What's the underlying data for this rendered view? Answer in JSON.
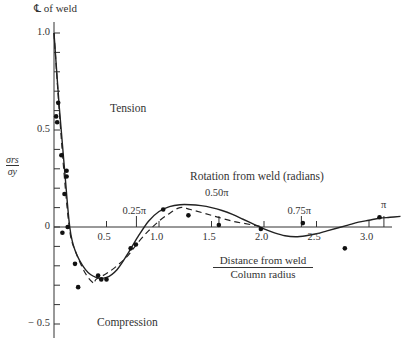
{
  "chart_data": {
    "type": "line",
    "title": "",
    "top_annotation": "℄ of weld",
    "xlabel_numerator": "Distance from weld",
    "xlabel_denominator": "Column radius",
    "ylabel_numerator": "σrs",
    "ylabel_denominator": "σy",
    "xlim": [
      0,
      3.3
    ],
    "ylim": [
      -0.55,
      1.05
    ],
    "x_ticks": [
      "0.5",
      "1.0",
      "1.5",
      "2.0",
      "2.5",
      "3.0"
    ],
    "x_tick_values": [
      0.5,
      1.0,
      1.5,
      2.0,
      2.5,
      3.0
    ],
    "y_ticks": [
      "1.0",
      "0.5",
      "0",
      "− 0.5"
    ],
    "y_tick_values": [
      1.0,
      0.5,
      0,
      -0.5
    ],
    "secondary_axis_label": "Rotation from weld (radians)",
    "secondary_ticks": [
      "0.25π",
      "0.50π",
      "0.75π",
      "π"
    ],
    "secondary_tick_positions": [
      0.785,
      1.571,
      2.356,
      3.142
    ],
    "region_labels": {
      "upper": "Tension",
      "lower": "Compression"
    },
    "grid": false,
    "series": [
      {
        "name": "Theory (solid)",
        "style": "solid",
        "x": [
          0.0,
          0.05,
          0.1,
          0.15,
          0.2,
          0.3,
          0.4,
          0.5,
          0.6,
          0.7,
          0.8,
          0.9,
          1.0,
          1.1,
          1.2,
          1.3,
          1.4,
          1.5,
          1.6,
          1.7,
          1.8,
          1.9,
          2.0,
          2.1,
          2.2,
          2.3,
          2.4,
          2.5,
          2.6,
          2.7,
          2.8,
          2.9,
          3.0,
          3.1,
          3.2,
          3.3
        ],
        "values": [
          1.0,
          0.62,
          0.3,
          0.0,
          -0.12,
          -0.22,
          -0.26,
          -0.26,
          -0.22,
          -0.14,
          -0.05,
          0.03,
          0.08,
          0.105,
          0.115,
          0.115,
          0.11,
          0.1,
          0.085,
          0.065,
          0.04,
          0.015,
          -0.01,
          -0.03,
          -0.045,
          -0.05,
          -0.045,
          -0.035,
          -0.02,
          -0.005,
          0.01,
          0.025,
          0.035,
          0.045,
          0.05,
          0.055
        ]
      },
      {
        "name": "Theory (dashed)",
        "style": "dashed",
        "x": [
          0.0,
          0.05,
          0.1,
          0.15,
          0.2,
          0.3,
          0.38,
          0.4,
          0.5,
          0.6,
          0.7,
          0.8,
          0.9,
          1.0,
          1.1,
          1.2,
          1.3,
          1.5,
          1.7,
          1.9,
          2.0
        ],
        "values": [
          1.0,
          0.6,
          0.25,
          -0.02,
          -0.12,
          -0.24,
          -0.29,
          -0.27,
          -0.24,
          -0.2,
          -0.15,
          -0.08,
          -0.02,
          0.03,
          0.07,
          0.1,
          0.09,
          0.06,
          0.03,
          0.01,
          0.0
        ]
      },
      {
        "name": "Experimental points",
        "style": "markers",
        "x": [
          0.02,
          0.03,
          0.04,
          0.07,
          0.1,
          0.12,
          0.12,
          0.13,
          0.08,
          0.2,
          0.23,
          0.42,
          0.45,
          0.5,
          0.73,
          0.78,
          1.04,
          1.28,
          1.57,
          1.97,
          2.37,
          2.77,
          3.1
        ],
        "values": [
          0.57,
          0.54,
          0.64,
          0.37,
          0.17,
          0.29,
          0.26,
          0.0,
          -0.03,
          -0.19,
          -0.31,
          -0.25,
          -0.27,
          -0.27,
          -0.11,
          -0.09,
          0.09,
          0.06,
          0.01,
          -0.01,
          0.02,
          -0.11,
          0.05
        ]
      }
    ]
  }
}
